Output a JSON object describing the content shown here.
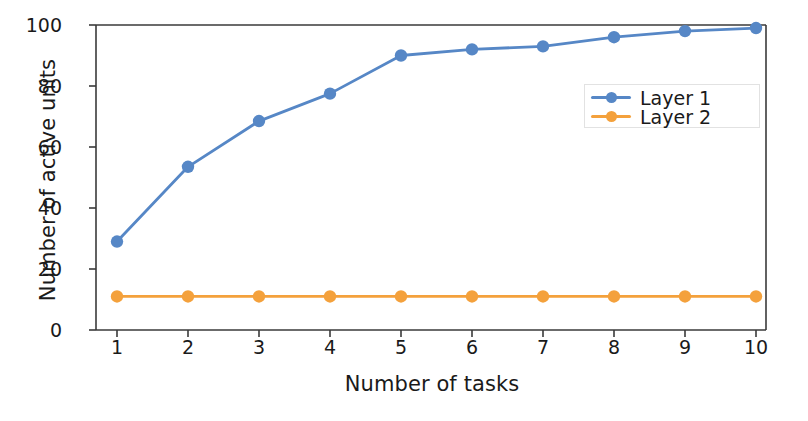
{
  "chart_data": {
    "type": "line",
    "title": "",
    "xlabel": "Number of tasks",
    "ylabel": "Number of active units",
    "x": [
      1,
      2,
      3,
      4,
      5,
      6,
      7,
      8,
      9,
      10
    ],
    "xticklabels": [
      "1",
      "2",
      "3",
      "4",
      "5",
      "6",
      "7",
      "8",
      "9",
      "10"
    ],
    "yticklabels": [
      "0",
      "20",
      "40",
      "60",
      "80",
      "100"
    ],
    "yticks": [
      0,
      20,
      40,
      60,
      80,
      100
    ],
    "xlim": [
      0.5,
      10.5
    ],
    "ylim": [
      0,
      100
    ],
    "grid": false,
    "legend_position": "center right",
    "series": [
      {
        "name": "Layer 1",
        "color": "#5687c6",
        "marker": "circle",
        "values": [
          29,
          53.5,
          68.5,
          77.5,
          90,
          92,
          93,
          96,
          98,
          99
        ]
      },
      {
        "name": "Layer 2",
        "color": "#f4a13c",
        "marker": "circle",
        "values": [
          11,
          11,
          11,
          11,
          11,
          11,
          11,
          11,
          11,
          11
        ]
      }
    ]
  },
  "axes": {
    "spine_color": "#3a3a3a",
    "background": "#ffffff"
  }
}
